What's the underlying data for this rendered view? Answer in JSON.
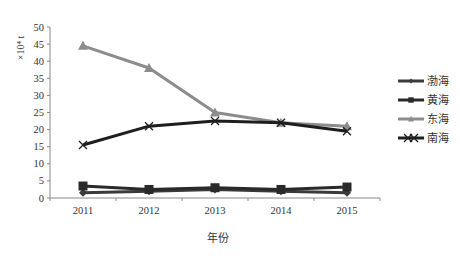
{
  "chart_data": {
    "type": "line",
    "title": "",
    "xlabel": "年份",
    "ylabel": "×10⁴ t",
    "categories": [
      "2011",
      "2012",
      "2013",
      "2014",
      "2015"
    ],
    "ylim": [
      0,
      50
    ],
    "yticks": [
      0,
      5,
      10,
      15,
      20,
      25,
      30,
      35,
      40,
      45,
      50
    ],
    "grid": false,
    "legend_position": "right",
    "series": [
      {
        "name": "渤海",
        "values": [
          1.5,
          2.0,
          2.5,
          2.0,
          1.5
        ],
        "color": "#3a3a3a",
        "marker": "diamond"
      },
      {
        "name": "黄海",
        "values": [
          3.5,
          2.5,
          3.0,
          2.5,
          3.2
        ],
        "color": "#2a2a2a",
        "marker": "square"
      },
      {
        "name": "东海",
        "values": [
          44.5,
          38.0,
          25.0,
          22.0,
          21.0
        ],
        "color": "#8c8c8c",
        "marker": "triangle"
      },
      {
        "name": "南海",
        "values": [
          15.5,
          21.0,
          22.5,
          22.0,
          19.5
        ],
        "color": "#1e1e1e",
        "marker": "x"
      }
    ]
  }
}
